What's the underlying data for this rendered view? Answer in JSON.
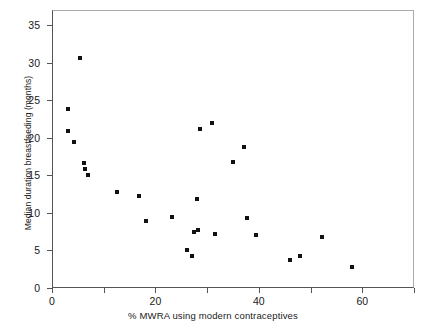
{
  "chart_data": {
    "type": "scatter",
    "title": "",
    "xlabel": "% MWRA using modern contraceptives",
    "ylabel": "Median duration breastfeeding (months)",
    "xlim": [
      0,
      70
    ],
    "ylim": [
      0,
      36.5
    ],
    "grid": false,
    "legend": null,
    "marker": "filled-square",
    "marker_color": "#111111",
    "xticks": [
      0,
      10,
      20,
      30,
      40,
      50,
      60,
      70
    ],
    "xtick_labels": [
      "0",
      "",
      "20",
      "",
      "40",
      "",
      "60",
      ""
    ],
    "yticks": [
      0,
      5,
      10,
      15,
      20,
      25,
      30,
      35
    ],
    "ytick_labels": [
      "0",
      "5",
      "10",
      "15",
      "20",
      "25",
      "30",
      "35"
    ],
    "points": [
      {
        "x": 5.5,
        "y": 30.6
      },
      {
        "x": 3.0,
        "y": 23.8
      },
      {
        "x": 3.1,
        "y": 20.9
      },
      {
        "x": 4.2,
        "y": 19.4
      },
      {
        "x": 6.2,
        "y": 16.6
      },
      {
        "x": 6.3,
        "y": 15.8
      },
      {
        "x": 6.9,
        "y": 15.1
      },
      {
        "x": 12.6,
        "y": 12.8
      },
      {
        "x": 16.9,
        "y": 12.3
      },
      {
        "x": 18.1,
        "y": 8.9
      },
      {
        "x": 23.3,
        "y": 9.4
      },
      {
        "x": 28.6,
        "y": 21.1
      },
      {
        "x": 30.9,
        "y": 22.0
      },
      {
        "x": 28.1,
        "y": 11.8
      },
      {
        "x": 27.4,
        "y": 7.4
      },
      {
        "x": 28.3,
        "y": 7.7
      },
      {
        "x": 26.2,
        "y": 5.1
      },
      {
        "x": 27.1,
        "y": 4.2
      },
      {
        "x": 31.5,
        "y": 7.2
      },
      {
        "x": 35.0,
        "y": 16.8
      },
      {
        "x": 37.1,
        "y": 18.7
      },
      {
        "x": 37.8,
        "y": 9.3
      },
      {
        "x": 39.4,
        "y": 7.0
      },
      {
        "x": 46.1,
        "y": 3.7
      },
      {
        "x": 48.0,
        "y": 4.3
      },
      {
        "x": 52.3,
        "y": 6.8
      },
      {
        "x": 58.0,
        "y": 2.8
      }
    ]
  }
}
